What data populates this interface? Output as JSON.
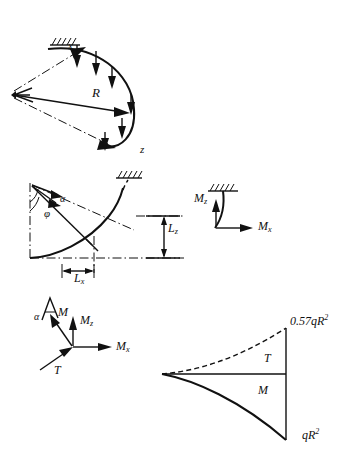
{
  "page": {
    "title_fragment": "",
    "background_color": "#ffffff",
    "ink_color": "#111111"
  },
  "figures": [
    {
      "id": "arch-3d",
      "name": "curved-arch-load-diagram",
      "labels": {
        "axis_x": "x",
        "axis_z": "z",
        "radius": "R"
      },
      "support": "fixed-hatched",
      "load_arrow_count": 6
    },
    {
      "id": "arc-geometry",
      "name": "arc-angle-geometry-diagram",
      "labels": {
        "angle_alpha": "α",
        "angle_phi": "φ",
        "dim_vertical": "L",
        "dim_vertical_sub": "z",
        "dim_horizontal": "L",
        "dim_horizontal_sub": "x"
      },
      "support": "fixed-hatched"
    },
    {
      "id": "cantilever-moments",
      "name": "cantilever-moment-diagram",
      "labels": {
        "moment_z": "M",
        "moment_z_sub": "z",
        "moment_x": "M",
        "moment_x_sub": "x"
      },
      "support": "fixed-hatched"
    },
    {
      "id": "force-node",
      "name": "internal-force-vector-diagram",
      "labels": {
        "angle_alpha": "α",
        "moment_m": "M",
        "moment_z": "M",
        "moment_z_sub": "z",
        "moment_x": "M",
        "moment_x_sub": "x",
        "torsion_t": "T"
      }
    },
    {
      "id": "moment-plot",
      "name": "bending-torsion-distribution-plot",
      "labels": {
        "peak_torsion": "0.57qR",
        "peak_torsion_exp": "2",
        "curve_t": "T",
        "curve_m": "M",
        "peak_moment": "qR",
        "peak_moment_exp": "2"
      }
    }
  ]
}
